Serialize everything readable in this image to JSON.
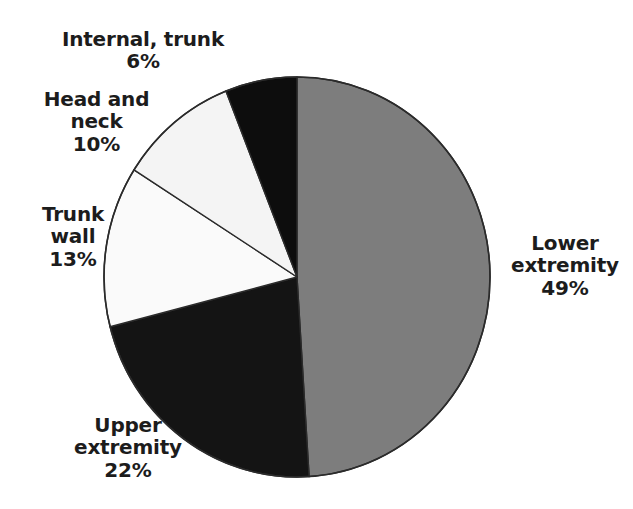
{
  "chart_data": {
    "type": "pie",
    "title": "",
    "subtitle": "",
    "xlabel": "",
    "ylabel": "",
    "legend_position": "none",
    "grid": false,
    "units": "percent",
    "start_angle_deg": 0,
    "direction": "clockwise",
    "categories": [
      "Lower extremity",
      "Upper extremity",
      "Trunk wall",
      "Head and neck",
      "Internal, trunk"
    ],
    "values": [
      49,
      22,
      13,
      10,
      6
    ],
    "slices": [
      {
        "id": "lower-extremity",
        "name": "Lower extremity",
        "value": 49,
        "value_text": "49%",
        "label_lines": [
          "Lower",
          "extremity",
          "49%"
        ],
        "fill": "#7d7d7d",
        "stroke": "#2b2b2b"
      },
      {
        "id": "upper-extremity",
        "name": "Upper extremity",
        "value": 22,
        "value_text": "22%",
        "label_lines": [
          "Upper",
          "extremity",
          "22%"
        ],
        "fill": "#141414",
        "stroke": "#2b2b2b"
      },
      {
        "id": "trunk-wall",
        "name": "Trunk wall",
        "value": 13,
        "value_text": "13%",
        "label_lines": [
          "Trunk",
          "wall",
          "13%"
        ],
        "fill": "#fafafa",
        "stroke": "#2b2b2b"
      },
      {
        "id": "head-and-neck",
        "name": "Head and neck",
        "value": 10,
        "value_text": "10%",
        "label_lines": [
          "Head and",
          "neck",
          "10%"
        ],
        "fill": "#f4f4f4",
        "stroke": "#2b2b2b"
      },
      {
        "id": "internal-trunk",
        "name": "Internal, trunk",
        "value": 6,
        "value_text": "6%",
        "label_lines": [
          "Internal, trunk",
          "6%"
        ],
        "fill": "#0d0d0d",
        "stroke": "#2b2b2b"
      }
    ]
  },
  "labels": {
    "internal_trunk": "Internal, trunk\n6%",
    "head_and_neck": "Head and\nneck\n10%",
    "trunk_wall": "Trunk\nwall\n13%",
    "upper_extremity": "Upper\nextremity\n22%",
    "lower_extremity": "Lower\nextremity\n49%"
  },
  "geometry": {
    "center_x": 297,
    "center_y": 277,
    "radius_x": 193,
    "radius_y": 200
  },
  "colors": {
    "background": "#ffffff",
    "gray_slice": "#7d7d7d",
    "black_slice": "#121212",
    "white_slice": "#f7f7f7",
    "outline": "#2b2b2b",
    "label_text": "#1c1c1c"
  }
}
